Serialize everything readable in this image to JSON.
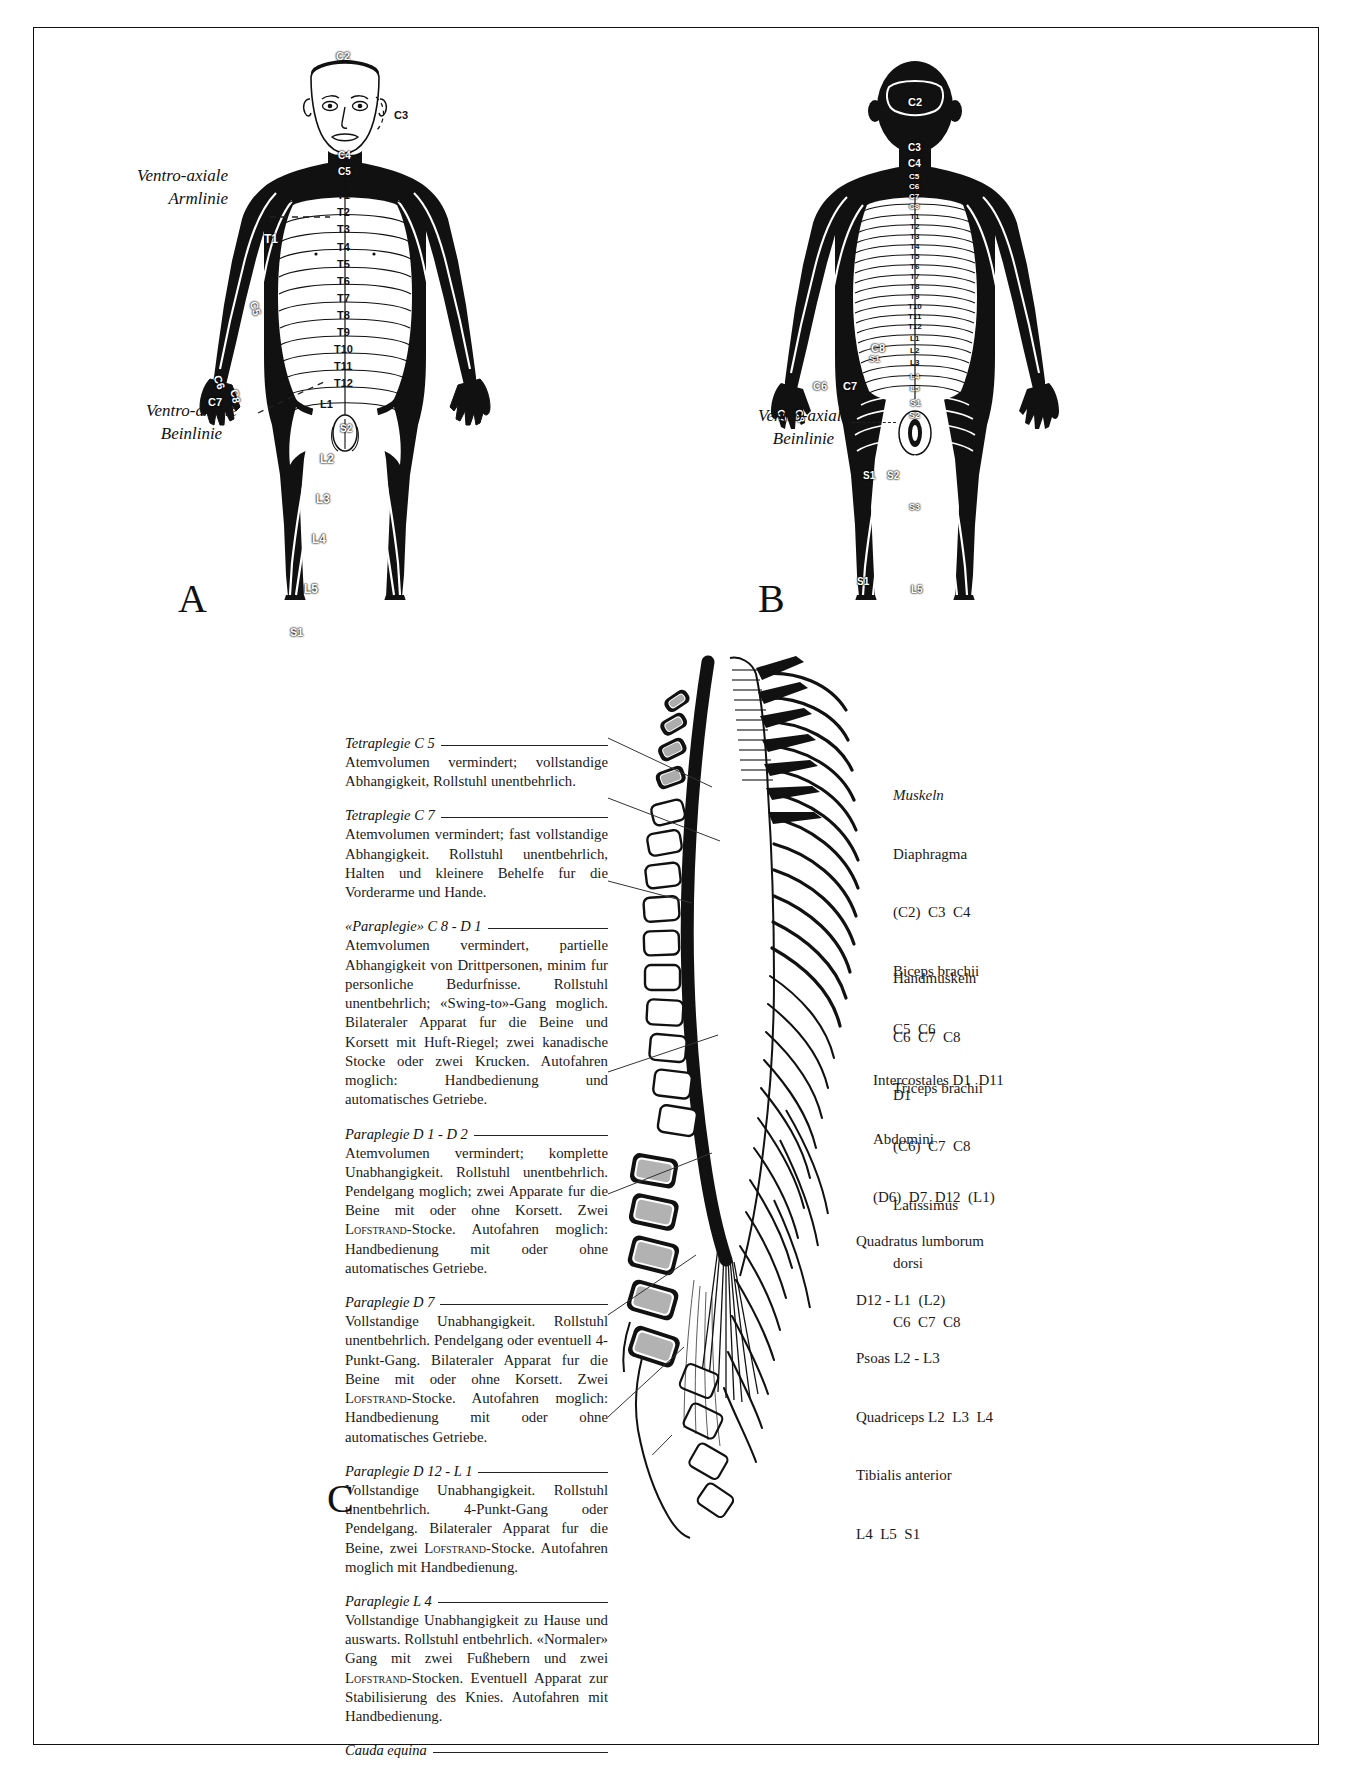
{
  "plate": {
    "figure_letters": {
      "a": "A",
      "b": "B",
      "c": "C"
    }
  },
  "figure_a": {
    "caption_letter": "A",
    "view": "anterior dermatome map",
    "annotations": [
      {
        "text": "Ventro-axiale",
        "line2": "Armlinie"
      },
      {
        "text": "Ventro-axiale",
        "line2": "Beinlinie"
      }
    ],
    "axial_arm_line": "Ventro-axiale",
    "axial_arm_line2": "Armlinie",
    "axial_leg_line": "Ventro-axiale",
    "axial_leg_line2": "Beinlinie",
    "dermatome_labels": [
      "C2",
      "C3",
      "C4",
      "C5",
      "T1",
      "T2",
      "T3",
      "T4",
      "T5",
      "T6",
      "T7",
      "T8",
      "T9",
      "T10",
      "T11",
      "T12",
      "L1",
      "L2",
      "L3",
      "L4",
      "L5",
      "S1",
      "C5",
      "C6",
      "C7",
      "C8",
      "T1",
      "S2"
    ]
  },
  "figure_b": {
    "caption_letter": "B",
    "view": "posterior dermatome map",
    "axial_leg_line": "Ventro-axiale",
    "axial_leg_line2": "Beinlinie",
    "dermatome_labels": [
      "C2",
      "C3",
      "C4",
      "C5",
      "C6",
      "C7",
      "C8",
      "T1",
      "T2",
      "T3",
      "T4",
      "T5",
      "T6",
      "T7",
      "T8",
      "T9",
      "T10",
      "T11",
      "T12",
      "L1",
      "L2",
      "L3",
      "L4",
      "L5",
      "S1",
      "S2",
      "S3",
      "S4",
      "C6",
      "C7",
      "C8"
    ]
  },
  "figure_c": {
    "caption_letter": "C",
    "blocks": [
      {
        "id": "tetraplegie-c5",
        "heading": "Tetraplegie C 5",
        "body": "Atemvolumen vermindert; vollstandige Abhangigkeit, Rollstuhl unentbehrlich."
      },
      {
        "id": "tetraplegie-c7",
        "heading": "Tetraplegie C 7",
        "body": "Atemvolumen vermindert; fast vollstandige Abhangigkeit. Rollstuhl unentbehrlich, Halten und kleinere Behelfe fur die Vorderarme und Hande."
      },
      {
        "id": "paraplegie-c8-d1",
        "heading": "«Paraplegie» C 8 - D 1",
        "body": "Atemvolumen vermindert, partielle Abhangigkeit von Drittpersonen, minim fur personliche Bedurfnisse. Rollstuhl unentbehrlich; «Swing-to»-Gang moglich. Bilateraler Apparat fur die Beine und Korsett mit Huft-Riegel; zwei kanadische Stocke oder zwei Krucken. Autofahren moglich: Handbedienung und automatisches Getriebe."
      },
      {
        "id": "paraplegie-d1-d2",
        "heading": "Paraplegie D 1 - D 2",
        "body_pre": "Atemvolumen vermindert; komplette Unabhangigkeit. Rollstuhl unentbehrlich. Pendelgang moglich; zwei Apparate fur die Beine mit oder ohne Korsett. Zwei ",
        "body_sc": "Lofstrand",
        "body_post": "-Stocke. Autofahren moglich: Handbedienung mit oder ohne automatisches Getriebe."
      },
      {
        "id": "paraplegie-d7",
        "heading": "Paraplegie D 7",
        "body_pre": "Vollstandige Unabhangigkeit. Rollstuhl unentbehrlich. Pendelgang oder eventuell 4-Punkt-Gang. Bilateraler Apparat fur die Beine mit oder ohne Korsett. Zwei ",
        "body_sc": "Lofstrand",
        "body_post": "-Stocke. Autofahren moglich: Handbedienung mit oder ohne automatisches Getriebe."
      },
      {
        "id": "paraplegie-d12-l1",
        "heading": "Paraplegie D 12 - L 1",
        "body_pre": "Vollstandige Unabhangigkeit. Rollstuhl unentbehrlich. 4-Punkt-Gang oder Pendelgang. Bilateraler Apparat fur die Beine, zwei ",
        "body_sc": "Lofstrand",
        "body_post": "-Stocke. Autofahren moglich mit Handbedienung."
      },
      {
        "id": "paraplegie-l4",
        "heading": "Paraplegie L 4",
        "body_pre": "Vollstandige Unabhangigkeit zu Hause und auswarts. Rollstuhl entbehrlich. «Normaler» Gang mit zwei Fußhebern und zwei ",
        "body_sc": "Lofstrand",
        "body_post": "-Stocken. Eventuell Apparat zur Stabilisierung des Knies. Autofahren mit Handbedienung."
      },
      {
        "id": "cauda-equina",
        "heading": "Cauda equina",
        "body": ""
      }
    ],
    "muscle_groups": [
      {
        "id": "muskeln-upper",
        "title": "Muskeln",
        "lines": [
          "Diaphragma",
          "(C2)  C3  C4",
          "Biceps brachii",
          "C5  C6",
          "Triceps brachii",
          "(C6)  C7  C8",
          "Latissimus",
          "dorsi",
          "C6  C7  C8"
        ]
      },
      {
        "id": "handmuskeln",
        "title": "",
        "lines": [
          "Handmuskeln",
          "C6  C7  C8",
          "D1"
        ]
      },
      {
        "id": "intercostales",
        "title": "",
        "lines": [
          "Intercostales D1  D11",
          "Abdomini",
          "(D6)  D7  D12  (L1)"
        ]
      },
      {
        "id": "lumbar-muscles",
        "title": "",
        "lines": [
          "Quadratus lumborum",
          "D12 - L1  (L2)",
          "Psoas L2 - L3",
          "Quadriceps L2  L3  L4",
          "Tibialis anterior",
          "L4  L5  S1"
        ]
      }
    ]
  }
}
